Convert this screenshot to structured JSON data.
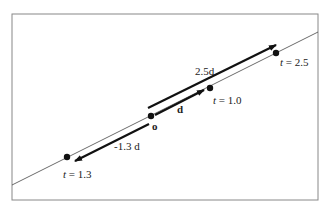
{
  "diagram": {
    "colors": {
      "line": "#444444",
      "arrow": "#111111",
      "frame": "#888888",
      "background": "#ffffff"
    },
    "origin": {
      "label": "o"
    },
    "direction": {
      "label": "d"
    },
    "arrows": [
      {
        "id": "forward-2.5d",
        "label": "2.5d"
      },
      {
        "id": "unit-d",
        "label": "d"
      },
      {
        "id": "backward-1.3d",
        "label": "-1.3 d"
      }
    ],
    "points": [
      {
        "id": "t-2.5",
        "t_symbol": "t",
        "eq": " = 2.5"
      },
      {
        "id": "t-1.0",
        "t_symbol": "t",
        "eq": " = 1.0"
      },
      {
        "id": "t-neg-1.3",
        "t_symbol": "t",
        "eq": " = 1.3"
      }
    ]
  }
}
